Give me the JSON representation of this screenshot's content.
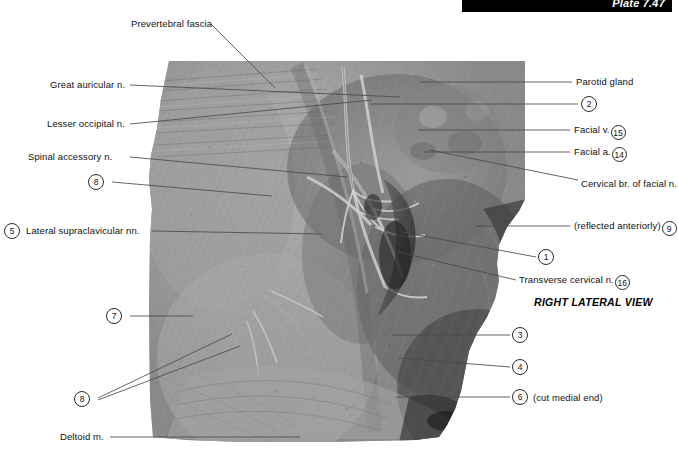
{
  "plate": {
    "banner_label": "Plate 7.47",
    "view_caption": "RIGHT LATERAL VIEW"
  },
  "labels_left": [
    {
      "id": "prevertebral-fascia",
      "text": "Prevertebral fascia"
    },
    {
      "id": "great-auricular-nerve",
      "text": "Great auricular n."
    },
    {
      "id": "lesser-occipital-nerve",
      "text": "Lesser occipital n."
    },
    {
      "id": "spinal-accessory-nerve",
      "text": "Spinal accessory n."
    },
    {
      "id": "lateral-supraclavicular-nerves",
      "text": "Lateral supraclavicular nn."
    },
    {
      "id": "deltoid-muscle",
      "text": "Deltoid m."
    }
  ],
  "labels_right": [
    {
      "id": "parotid-gland",
      "text": "Parotid gland"
    },
    {
      "id": "facial-vein",
      "text": "Facial v."
    },
    {
      "id": "facial-artery",
      "text": "Facial a."
    },
    {
      "id": "cervical-branch-facial-nerve",
      "text": "Cervical br. of facial n."
    },
    {
      "id": "reflected-anteriorly",
      "text": "(reflected anteriorly)"
    },
    {
      "id": "transverse-cervical-nerve",
      "text": "Transverse cervical n."
    },
    {
      "id": "cut-medial-end",
      "text": "(cut medial end)"
    }
  ],
  "reference_numbers": {
    "left_8_upper": "8",
    "left_5_supraclavicular": "5",
    "left_7": "7",
    "left_8_lower": "8",
    "right_2": "2",
    "right_15_facial_vein": "15",
    "right_14_facial_artery": "14",
    "right_9_reflected": "9",
    "right_1": "1",
    "right_16_transverse_cervical": "16",
    "right_3": "3",
    "right_4": "4",
    "right_6_cut_medial_end": "6"
  },
  "colors": {
    "banner_background": "#000000",
    "banner_text": "#ffffff",
    "label_text": "#111111",
    "leader_line": "#4a4a4a",
    "page_background": "#ffffff"
  }
}
